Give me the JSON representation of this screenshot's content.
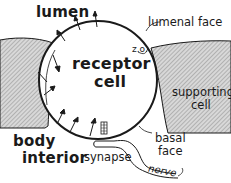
{
  "diagram": {
    "labels": {
      "lumen": "lumen",
      "lumenal_face": "lumenal face",
      "zo": "z.o.",
      "receptor_line1": "receptor",
      "receptor_line2": "cell",
      "supporting_line1": "supporting",
      "supporting_line2": "cell",
      "body_line1": "body",
      "body_line2": "interior",
      "basal_line1": "basal",
      "basal_line2": "face",
      "synapse": "synapse",
      "nerve": "nerve"
    },
    "colors": {
      "ink": "#1a1a1a",
      "hatch": "#bdbdbd",
      "background": "#ffffff"
    }
  }
}
